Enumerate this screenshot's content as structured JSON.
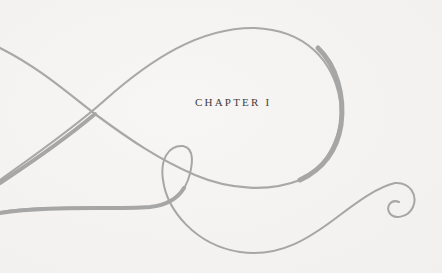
{
  "page": {
    "chapter_heading": "CHAPTER I",
    "ornament": {
      "icon": "decorative-swash-flourish",
      "stroke_color": "#a6a6a6",
      "background_color": "#f4f3f1"
    }
  }
}
